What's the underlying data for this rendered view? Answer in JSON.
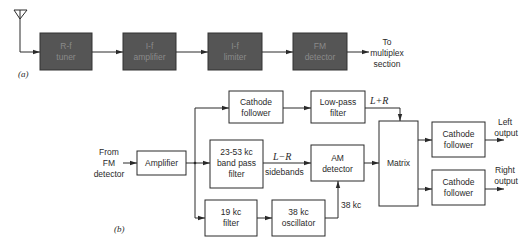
{
  "diagram_a": {
    "label": "(a)",
    "blocks": [
      {
        "id": "rf-tuner",
        "lines": [
          "R-f",
          "tuner"
        ]
      },
      {
        "id": "if-amplifier",
        "lines": [
          "I-f",
          "amplifier"
        ]
      },
      {
        "id": "if-limiter",
        "lines": [
          "I-f",
          "limiter"
        ]
      },
      {
        "id": "fm-detector",
        "lines": [
          "FM",
          "detector"
        ]
      }
    ],
    "output_text": [
      "To",
      "multiplex",
      "section"
    ],
    "antenna": "antenna-icon"
  },
  "diagram_b": {
    "label": "(b)",
    "input_text": [
      "From",
      "FM",
      "detector"
    ],
    "blocks": {
      "amplifier": {
        "lines": [
          "Amplifier"
        ]
      },
      "cathode_follower_top": {
        "lines": [
          "Cathode",
          "follower"
        ]
      },
      "low_pass_filter": {
        "lines": [
          "Low-pass",
          "filter"
        ]
      },
      "band_pass_filter": {
        "lines": [
          "23-53 kc",
          "band pass",
          "filter"
        ]
      },
      "am_detector": {
        "lines": [
          "AM",
          "detector"
        ]
      },
      "filter_19kc": {
        "lines": [
          "19 kc",
          "filter"
        ]
      },
      "oscillator_38kc": {
        "lines": [
          "38 kc",
          "oscillator"
        ]
      },
      "matrix": {
        "lines": [
          "Matrix"
        ]
      },
      "cathode_follower_left": {
        "lines": [
          "Cathode",
          "follower"
        ]
      },
      "cathode_follower_right": {
        "lines": [
          "Cathode",
          "follower"
        ]
      }
    },
    "signal_labels": {
      "l_plus_r": "L+R",
      "l_minus_r": "L−R",
      "sidebands": "sidebands",
      "carrier_38kc": "38 kc"
    },
    "outputs": {
      "left": [
        "Left",
        "output"
      ],
      "right": [
        "Right",
        "output"
      ]
    }
  }
}
